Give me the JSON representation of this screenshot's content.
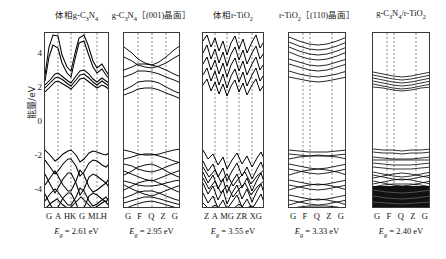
{
  "figure": {
    "yaxis": {
      "label": "能量/eV",
      "ticks": [
        "4",
        "2",
        "0",
        "-2",
        "-4"
      ],
      "tick_values": [
        4,
        2,
        0,
        -2,
        -4
      ],
      "range": [
        -5.2,
        5.2
      ]
    },
    "panels": [
      {
        "title_html": "体相g-C<sub>3</sub>N<sub>4</sub>",
        "title_text": "体相g-C3N4",
        "kpoints": [
          "G",
          "A",
          "HK",
          "G",
          "MLH"
        ],
        "eg_value": "2.61",
        "eg_unit": "eV",
        "eg_text": "Eg = 2.61 eV"
      },
      {
        "title_html": "g-C<sub>3</sub>N<sub>4</sub>［(001)晶面］",
        "title_text": "g-C3N4 [(001)晶面]",
        "kpoints": [
          "G",
          "F",
          "Q",
          "Z",
          "G"
        ],
        "eg_value": "2.95",
        "eg_unit": "eV",
        "eg_text": "Eg = 2.95 eV"
      },
      {
        "title_html": "体相r-TiO<sub>2</sub>",
        "title_text": "体相r-TiO2",
        "kpoints": [
          "Z",
          "A",
          "MG",
          "ZR",
          "XG"
        ],
        "eg_value": "3.55",
        "eg_unit": "eV",
        "eg_text": "Eg = 3.55 eV"
      },
      {
        "title_html": "r-TiO<sub>2</sub>［(110)晶面］",
        "title_text": "r-TiO2 [(110)晶面]",
        "kpoints": [
          "G",
          "F",
          "Q",
          "Z",
          "G"
        ],
        "eg_value": "3.33",
        "eg_unit": "eV",
        "eg_text": "Eg = 3.33 eV"
      },
      {
        "title_html": "g-C<sub>3</sub>N<sub>4</sub>/r-TiO<sub>2</sub>",
        "title_text": "g-C3N4/r-TiO2",
        "kpoints": [
          "G",
          "F",
          "Q",
          "Z",
          "G"
        ],
        "eg_value": "2.40",
        "eg_unit": "eV",
        "eg_text": "Eg = 2.40 eV"
      }
    ]
  },
  "chart_data": {
    "type": "line",
    "title": "",
    "xlabel": "",
    "ylabel": "能量/eV",
    "ylim": [
      -5.2,
      5.2
    ],
    "yticks": [
      4,
      2,
      0,
      -2,
      -4
    ],
    "grid": "vertical dashed lines at high-symmetry k-points",
    "legend": "none",
    "subplots": [
      {
        "name": "体相g-C3N4",
        "band_gap_eV": 2.61,
        "kpath": [
          "G",
          "A",
          "HK",
          "G",
          "MLH"
        ],
        "valence_band_max_eV": 0.0,
        "conduction_band_min_eV": 2.61,
        "bands": [
          {
            "name": "cb4",
            "y": [
              3.1,
              4.9,
              5.2,
              4.4,
              3.3,
              3.0,
              4.6,
              5.2,
              4.9,
              3.6,
              3.1,
              3.3,
              3.6,
              3.5,
              3.2
            ]
          },
          {
            "name": "cb3",
            "y": [
              2.8,
              3.9,
              4.6,
              3.7,
              3.0,
              2.7,
              3.8,
              4.8,
              4.3,
              3.1,
              2.9,
              3.2,
              3.4,
              3.3,
              3.0
            ]
          },
          {
            "name": "cb2",
            "y": [
              2.75,
              3.3,
              3.45,
              3.3,
              2.95,
              2.65,
              3.25,
              3.4,
              3.3,
              3.0,
              2.85,
              3.05,
              3.2,
              3.1,
              2.9
            ]
          },
          {
            "name": "cb1",
            "y": [
              2.61,
              3.15,
              3.3,
              3.2,
              2.9,
              2.61,
              3.1,
              3.3,
              3.2,
              2.95,
              2.8,
              2.95,
              3.1,
              3.0,
              2.85
            ]
          },
          {
            "name": "vb1",
            "y": [
              0.0,
              -0.35,
              -0.7,
              -0.55,
              -0.2,
              0.0,
              -0.4,
              -0.75,
              -0.5,
              -0.15,
              -0.05,
              -0.2,
              -0.3,
              -0.25,
              -0.1
            ]
          },
          {
            "name": "vb2",
            "y": [
              -0.6,
              -1.0,
              -1.4,
              -1.2,
              -0.8,
              -0.55,
              -1.05,
              -1.5,
              -1.1,
              -0.7,
              -0.6,
              -0.85,
              -1.0,
              -0.9,
              -0.7
            ]
          },
          {
            "name": "vb3",
            "y": [
              -1.4,
              -2.0,
              -2.5,
              -2.2,
              -1.7,
              -1.35,
              -2.1,
              -2.6,
              -2.2,
              -1.6,
              -1.5,
              -1.8,
              -2.0,
              -1.9,
              -1.6
            ]
          },
          {
            "name": "vb4",
            "y": [
              -2.6,
              -3.2,
              -3.7,
              -3.3,
              -2.9,
              -2.55,
              -3.3,
              -3.9,
              -3.4,
              -2.8,
              -2.7,
              -3.0,
              -3.2,
              -3.1,
              -2.8
            ]
          },
          {
            "name": "vb5",
            "y": [
              -3.6,
              -4.2,
              -4.7,
              -4.3,
              -3.9,
              -3.5,
              -4.3,
              -4.9,
              -4.4,
              -3.8,
              -3.7,
              -4.0,
              -4.2,
              -4.1,
              -3.8
            ]
          },
          {
            "name": "vb6",
            "y": [
              -4.3,
              -4.8,
              -5.1,
              -4.9,
              -4.5,
              -4.2,
              -4.9,
              -5.2,
              -5.0,
              -4.4,
              -4.4,
              -4.6,
              -4.8,
              -4.7,
              -4.5
            ]
          }
        ]
      },
      {
        "name": "g-C3N4 [(001)晶面]",
        "band_gap_eV": 2.95,
        "kpath": [
          "G",
          "F",
          "Q",
          "Z",
          "G"
        ],
        "valence_band_max_eV": 0.0,
        "conduction_band_min_eV": 2.95,
        "bands": [
          {
            "name": "cb4",
            "y": [
              4.9,
              4.5,
              4.25,
              4.3,
              4.55,
              4.9,
              5.1
            ]
          },
          {
            "name": "cb3",
            "y": [
              4.35,
              4.2,
              4.05,
              4.1,
              4.2,
              4.4,
              4.6
            ]
          },
          {
            "name": "cb2",
            "y": [
              3.75,
              3.95,
              4.0,
              3.95,
              3.8,
              3.7,
              3.9
            ]
          },
          {
            "name": "cb1",
            "y": [
              3.05,
              3.25,
              3.4,
              3.35,
              3.15,
              2.95,
              3.2
            ]
          },
          {
            "name": "vb1",
            "y": [
              0.0,
              -0.15,
              -0.3,
              -0.3,
              -0.2,
              0.0,
              -0.1
            ]
          },
          {
            "name": "vb2",
            "y": [
              -0.6,
              -0.75,
              -0.9,
              -0.9,
              -0.8,
              -0.6,
              -0.7
            ]
          },
          {
            "name": "vb3",
            "y": [
              -1.5,
              -1.35,
              -1.25,
              -1.3,
              -1.4,
              -1.5,
              -1.4
            ]
          },
          {
            "name": "vb4",
            "y": [
              -2.1,
              -2.3,
              -2.45,
              -2.4,
              -2.25,
              -2.05,
              -2.2
            ]
          },
          {
            "name": "vb5",
            "y": [
              -2.9,
              -2.75,
              -2.65,
              -2.7,
              -2.8,
              -2.95,
              -2.85
            ]
          },
          {
            "name": "vb6",
            "y": [
              -3.6,
              -3.8,
              -3.95,
              -3.9,
              -3.75,
              -3.55,
              -3.7
            ]
          },
          {
            "name": "vb7",
            "y": [
              -4.4,
              -4.25,
              -4.15,
              -4.2,
              -4.3,
              -4.45,
              -4.35
            ]
          },
          {
            "name": "vb8",
            "y": [
              -5.0,
              -4.85,
              -4.7,
              -4.75,
              -4.9,
              -5.05,
              -4.95
            ]
          }
        ]
      },
      {
        "name": "体相r-TiO2",
        "band_gap_eV": 3.55,
        "kpath": [
          "Z",
          "A",
          "MG",
          "ZR",
          "XG"
        ],
        "valence_band_max_eV": 0.0,
        "conduction_band_min_eV": 3.55,
        "bands": [
          {
            "name": "cb_dense",
            "y": [
              3.6,
              4.6,
              4.1,
              5.0,
              4.3,
              4.9,
              3.9,
              4.7,
              4.2,
              5.1,
              4.4,
              4.8,
              3.7,
              4.5,
              4.0
            ]
          },
          {
            "name": "vb_dense",
            "y": [
              0.0,
              -0.9,
              -0.4,
              -1.3,
              -0.7,
              -1.5,
              -0.5,
              -1.1,
              -0.6,
              -1.4,
              -0.8,
              -1.2,
              -0.3,
              -1.0,
              -0.45
            ]
          }
        ]
      },
      {
        "name": "r-TiO2 [(110)晶面]",
        "band_gap_eV": 3.33,
        "kpath": [
          "G",
          "F",
          "Q",
          "Z",
          "G"
        ],
        "valence_band_max_eV": 0.0,
        "conduction_band_min_eV": 3.33,
        "bands": [
          {
            "name": "cb_manifold",
            "y": [
              3.4,
              3.9,
              4.3,
              4.6,
              4.9,
              5.1
            ]
          },
          {
            "name": "vb_manifold",
            "y": [
              0.0,
              -0.6,
              -1.3,
              -2.0,
              -2.7,
              -3.4,
              -4.1,
              -4.8
            ]
          }
        ]
      },
      {
        "name": "g-C3N4/r-TiO2",
        "band_gap_eV": 2.4,
        "kpath": [
          "G",
          "F",
          "Q",
          "Z",
          "G"
        ],
        "valence_band_max_eV": 0.0,
        "conduction_band_min_eV": 2.4,
        "bands": [
          {
            "name": "cb_manifold",
            "y": [
              2.45,
              2.7,
              3.4,
              4.1,
              4.6,
              5.0
            ]
          },
          {
            "name": "vb_manifold",
            "y": [
              0.0,
              -0.3,
              -0.9,
              -1.6,
              -2.3,
              -3.0,
              -3.8,
              -4.6
            ]
          }
        ]
      }
    ]
  }
}
